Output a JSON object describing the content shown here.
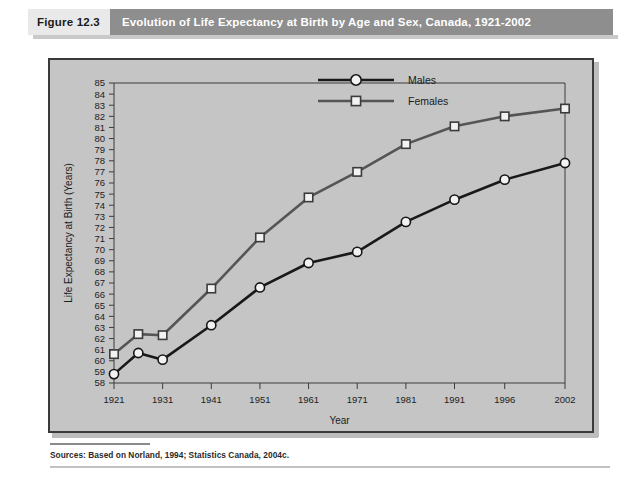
{
  "figure": {
    "number": "Figure 12.3",
    "title": "Evolution of Life Expectancy at Birth by Age and Sex, Canada, 1921-2002",
    "source": "Sources: Based on Norland, 1994; Statistics Canada, 2004c."
  },
  "colors": {
    "header_band": "#8e8e8e",
    "header_number_bg": "#e9e9e9",
    "panel_bg": "#c5c5c5",
    "males_line": "#191919",
    "females_line": "#555555",
    "marker_fill": "#f2f2f2"
  },
  "chart_data": {
    "type": "line",
    "title": "Evolution of Life Expectancy at Birth by Age and Sex, Canada, 1921-2002",
    "xlabel": "Year",
    "ylabel": "Life Expectancy at Birth (Years)",
    "ylim": [
      58,
      85
    ],
    "ytick_step": 1,
    "yticks": [
      58,
      59,
      60,
      61,
      62,
      63,
      64,
      65,
      66,
      67,
      68,
      69,
      70,
      71,
      72,
      73,
      74,
      75,
      76,
      77,
      78,
      79,
      80,
      81,
      82,
      83,
      84,
      85
    ],
    "grid": false,
    "legend_position": "top-center",
    "x": [
      1921,
      1926,
      1931,
      1941,
      1951,
      1961,
      1971,
      1981,
      1991,
      1996,
      2002
    ],
    "xticks": [
      1921,
      1931,
      1941,
      1951,
      1961,
      1971,
      1981,
      1991,
      1996,
      2002
    ],
    "xtick_labels": [
      "1921",
      "1931",
      "1941",
      "1951",
      "1961",
      "1971",
      "1981",
      "1991",
      "1996",
      "2002"
    ],
    "series": [
      {
        "name": "Males",
        "marker": "circle",
        "values": [
          58.8,
          60.7,
          60.1,
          63.2,
          66.6,
          68.8,
          69.8,
          72.5,
          74.5,
          76.3,
          77.8
        ]
      },
      {
        "name": "Females",
        "marker": "square",
        "values": [
          60.6,
          62.4,
          62.3,
          66.5,
          71.1,
          74.7,
          77.0,
          79.5,
          81.1,
          82.0,
          82.7
        ]
      }
    ]
  },
  "legend": {
    "males_label": "Males",
    "females_label": "Females"
  }
}
